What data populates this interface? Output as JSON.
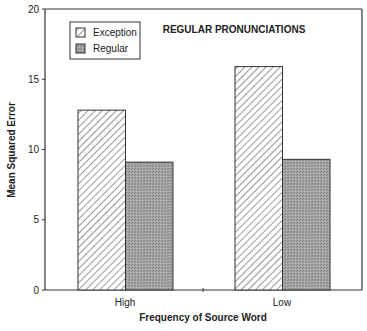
{
  "chart_data": {
    "type": "bar",
    "title": "REGULAR PRONUNCIATIONS",
    "xlabel": "Frequency of Source Word",
    "ylabel": "Mean Squared Error",
    "categories": [
      "High",
      "Low"
    ],
    "series": [
      {
        "name": "Exception",
        "values": [
          12.8,
          15.9
        ],
        "fill": "hatch"
      },
      {
        "name": "Regular",
        "values": [
          9.1,
          9.3
        ],
        "fill": "#9a9a9a"
      }
    ],
    "ylim": [
      0,
      20
    ],
    "yticks": [
      0,
      5,
      10,
      15,
      20
    ],
    "grid": false,
    "legend_position": "upper-left"
  },
  "colors": {
    "axis": "#333333",
    "regular_fill": "#9a9a9a",
    "hatch_stroke": "#444444"
  }
}
